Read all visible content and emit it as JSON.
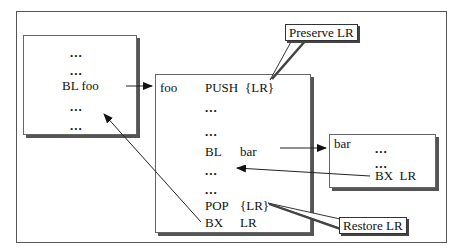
{
  "diagram": {
    "caller_box": {
      "lines": [
        "...",
        "...",
        "BL foo",
        "...",
        "..."
      ]
    },
    "foo_box": {
      "label": "foo",
      "rows": [
        {
          "op": "PUSH",
          "arg": "{LR}"
        },
        {
          "op": "...",
          "arg": ""
        },
        {
          "op": "...",
          "arg": ""
        },
        {
          "op": "BL",
          "arg": "bar"
        },
        {
          "op": "...",
          "arg": ""
        },
        {
          "op": "...",
          "arg": ""
        },
        {
          "op": "POP",
          "arg": "{LR}"
        },
        {
          "op": "BX",
          "arg": "LR"
        }
      ]
    },
    "bar_box": {
      "label": "bar",
      "lines": [
        "...",
        "...",
        "BX  LR"
      ]
    },
    "callouts": {
      "preserve": "Preserve LR",
      "restore": "Restore LR"
    },
    "colors": {
      "line": "#333333",
      "shadow": "#555555",
      "background": "#ffffff"
    }
  }
}
